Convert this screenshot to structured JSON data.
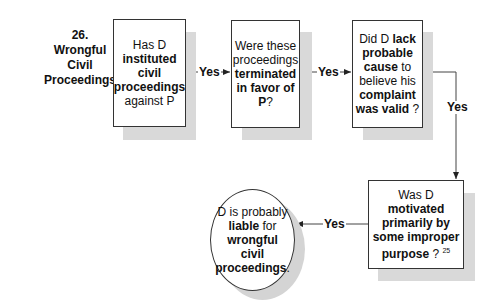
{
  "diagram": {
    "title_number": "26.",
    "title_lines": [
      "Wrongful",
      "Civil",
      "Proceedings"
    ],
    "nodes": [
      {
        "id": "q1",
        "shape": "rectangle",
        "segments": [
          {
            "text": "Has D ",
            "bold": false
          },
          {
            "text": "instituted civil proceedings",
            "bold": true
          },
          {
            "text": " against P",
            "bold": false
          }
        ]
      },
      {
        "id": "q2",
        "shape": "rectangle",
        "segments": [
          {
            "text": "Were these proceedings ",
            "bold": false
          },
          {
            "text": "terminated in favor of P",
            "bold": true
          },
          {
            "text": "?",
            "bold": false
          }
        ]
      },
      {
        "id": "q3",
        "shape": "rectangle",
        "segments": [
          {
            "text": "Did D ",
            "bold": false
          },
          {
            "text": "lack probable cause",
            "bold": true
          },
          {
            "text": " to believe his ",
            "bold": false
          },
          {
            "text": "complaint was valid",
            "bold": true
          },
          {
            "text": " ?",
            "bold": false
          }
        ]
      },
      {
        "id": "q4",
        "shape": "rectangle",
        "segments": [
          {
            "text": "Was D ",
            "bold": false
          },
          {
            "text": "motivated primarily by some improper purpose",
            "bold": true
          },
          {
            "text": " ?",
            "bold": false
          }
        ],
        "footnote": "25"
      },
      {
        "id": "result",
        "shape": "ellipse",
        "segments": [
          {
            "text": "D is probably ",
            "bold": false
          },
          {
            "text": "liable",
            "bold": true
          },
          {
            "text": " for ",
            "bold": false
          },
          {
            "text": "wrongful civil proceedings",
            "bold": true
          },
          {
            "text": ".",
            "bold": false
          }
        ]
      }
    ],
    "edges": [
      {
        "from": "q1",
        "to": "q2",
        "label": "Yes"
      },
      {
        "from": "q2",
        "to": "q3",
        "label": "Yes"
      },
      {
        "from": "q3",
        "to": "q4",
        "label": "Yes"
      },
      {
        "from": "q4",
        "to": "result",
        "label": "Yes"
      }
    ],
    "colors": {
      "border": "#333333",
      "shadow": "#d9d9d9",
      "background": "#ffffff",
      "text": "#111111"
    }
  }
}
